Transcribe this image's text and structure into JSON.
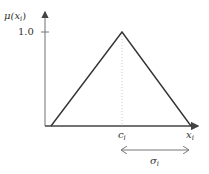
{
  "diagram": {
    "type": "triangular-membership-function",
    "y_axis_label": "μ(x",
    "y_axis_label_sub": "i",
    "y_axis_label_close": ")",
    "y_tick_label": "1.0",
    "x_axis_label": "x",
    "x_axis_label_sub": "i",
    "center_label": "c",
    "center_label_sub": "i",
    "width_label": "σ",
    "width_label_sub": "i",
    "colors": {
      "axis": "#777777",
      "triangle": "#333333",
      "guide": "#cccccc",
      "text": "#333333"
    }
  }
}
